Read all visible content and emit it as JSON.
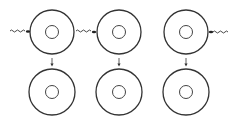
{
  "diagram": {
    "stroke_color": "#333333",
    "eggs": [
      {
        "id": "egg-1",
        "cx": 52,
        "cy": 32,
        "r": 22,
        "nucleus_r": 6.5,
        "sperm_side": "left"
      },
      {
        "id": "egg-2",
        "cx": 119,
        "cy": 32,
        "r": 22,
        "nucleus_r": 6.5,
        "sperm_side": "left"
      },
      {
        "id": "egg-3",
        "cx": 186,
        "cy": 32,
        "r": 22,
        "nucleus_r": 6.5,
        "sperm_side": "right"
      }
    ],
    "results": [
      {
        "id": "result-1",
        "cx": 52,
        "cy": 92,
        "r": 23,
        "nucleus_r": 6.5
      },
      {
        "id": "result-2",
        "cx": 119,
        "cy": 92,
        "r": 23,
        "nucleus_r": 6.5
      },
      {
        "id": "result-3",
        "cx": 186,
        "cy": 92,
        "r": 23,
        "nucleus_r": 6.5
      }
    ]
  }
}
